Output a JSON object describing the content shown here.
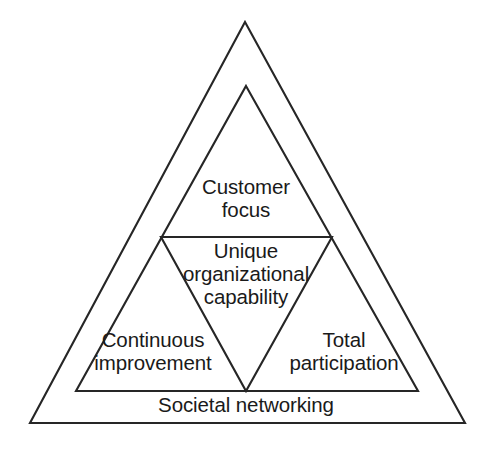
{
  "diagram": {
    "type": "nested-triangle",
    "background_color": "#ffffff",
    "stroke_color": "#262626",
    "text_color": "#1a1a1a",
    "layers": {
      "outer": {
        "name": "societal-networking-band",
        "label": "Societal networking",
        "points": "245,22 465,423 30,423"
      },
      "middle": {
        "name": "core-principles-triangle",
        "points": "246,86 418,391 76,391"
      },
      "inverted": {
        "name": "unique-capability-triangle",
        "points": "161,237 332,237 246,391"
      }
    },
    "labels": {
      "customer_focus": "Customer\nfocus",
      "unique_capability": "Unique\norganizational\ncapability",
      "continuous_improvement": "Continuous\nimprovement",
      "total_participation": "Total\nparticipation",
      "societal_networking": "Societal networking"
    }
  }
}
